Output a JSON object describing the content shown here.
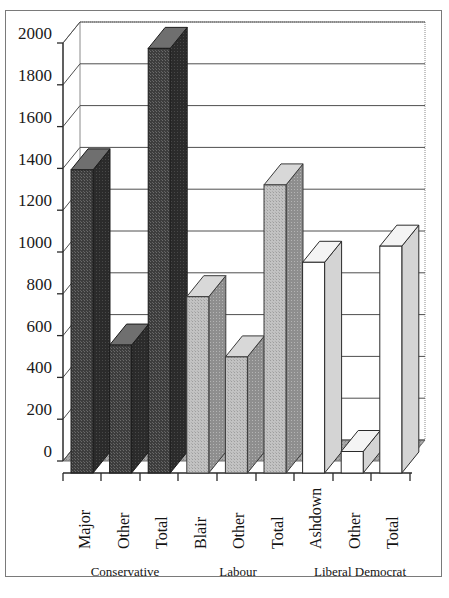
{
  "chart_data": {
    "type": "bar",
    "title": "",
    "xlabel": "",
    "ylabel": "",
    "ylim": [
      0,
      2000
    ],
    "ytick_step": 200,
    "yticks": [
      "0",
      "200",
      "400",
      "600",
      "800",
      "1000",
      "1200",
      "1400",
      "1600",
      "1800",
      "2000"
    ],
    "grid": true,
    "legend": "none",
    "style": "3d-column",
    "categories": [
      "Major",
      "Other",
      "Total",
      "Blair",
      "Other",
      "Total",
      "Ashdown",
      "Other",
      "Total"
    ],
    "values": [
      1410,
      595,
      1975,
      820,
      540,
      1340,
      980,
      100,
      1055
    ],
    "groups": [
      {
        "label": "Conservative",
        "categories": [
          "Major",
          "Other",
          "Total"
        ],
        "values": [
          1410,
          595,
          1975
        ],
        "color": "#4a4a4a"
      },
      {
        "label": "Labour",
        "categories": [
          "Blair",
          "Other",
          "Total"
        ],
        "values": [
          820,
          540,
          1340
        ],
        "color": "#bdbdbd"
      },
      {
        "label": "Liberal Democrat",
        "categories": [
          "Ashdown",
          "Other",
          "Total"
        ],
        "values": [
          980,
          100,
          1055
        ],
        "color": "#ffffff"
      }
    ],
    "colors": {
      "conservative": "#4a4a4a",
      "labour": "#bdbdbd",
      "liberal_democrat": "#ffffff",
      "floor": "#9a9a9a",
      "gridline": "#555555",
      "border": "#7a7a7a",
      "text": "#141414"
    }
  }
}
